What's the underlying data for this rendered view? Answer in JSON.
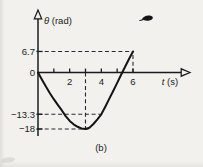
{
  "figure": {
    "caption": "(b)",
    "paper_color": "#f2f1ee",
    "ink_color": "#1b1b1b"
  },
  "labels": {
    "y_symbol": "θ",
    "y_unit": " (rad)",
    "x_symbol": "t",
    "x_unit": " (s)"
  },
  "chart_data": {
    "type": "line",
    "title": "",
    "xlabel": "t (s)",
    "ylabel": "θ (rad)",
    "xlim": [
      0,
      9.5
    ],
    "ylim": [
      -21,
      20
    ],
    "grid": false,
    "legend": "none",
    "x_ticks": [
      {
        "t": 1,
        "label": ""
      },
      {
        "t": 2,
        "label": "2"
      },
      {
        "t": 3,
        "label": ""
      },
      {
        "t": 4,
        "label": "4"
      },
      {
        "t": 5,
        "label": ""
      },
      {
        "t": 6,
        "label": "6"
      }
    ],
    "y_ticks": [
      {
        "v": 6.7,
        "label": "6.7",
        "tick": true
      },
      {
        "v": 0,
        "label": "0",
        "tick": false
      },
      {
        "v": -13.3,
        "label": "−13.3",
        "tick": true
      },
      {
        "v": -18,
        "label": "−18",
        "tick": true
      }
    ],
    "guides": [
      {
        "axis": "y",
        "value": 6.7,
        "t_end": 6
      },
      {
        "axis": "y",
        "value": -13.3,
        "t_end": 4.05
      },
      {
        "axis": "y",
        "value": -18,
        "t_end": 3.2
      },
      {
        "axis": "x",
        "value": 3,
        "v_end": -18
      },
      {
        "axis": "x",
        "value": 6,
        "v_end": 6.7
      }
    ],
    "key_points": {
      "start": [
        0,
        0
      ],
      "minimum": [
        3,
        -18
      ],
      "marked_point": [
        4,
        -13.3
      ],
      "zero_crossing": [
        5.3,
        0
      ],
      "end": [
        6,
        6.7
      ]
    },
    "series": [
      {
        "name": "theta-vs-t",
        "points": [
          [
            0,
            0
          ],
          [
            0.25,
            -2.3
          ],
          [
            0.5,
            -4.5
          ],
          [
            0.75,
            -6.6
          ],
          [
            1,
            -8.5
          ],
          [
            1.25,
            -10.3
          ],
          [
            1.5,
            -12.0
          ],
          [
            1.75,
            -13.9
          ],
          [
            2,
            -15.4
          ],
          [
            2.25,
            -16.5
          ],
          [
            2.5,
            -17.3
          ],
          [
            2.75,
            -17.8
          ],
          [
            3,
            -18
          ],
          [
            3.25,
            -17.6
          ],
          [
            3.5,
            -16.4
          ],
          [
            3.75,
            -14.9
          ],
          [
            4,
            -13.3
          ],
          [
            4.25,
            -10.9
          ],
          [
            4.5,
            -8.4
          ],
          [
            4.75,
            -5.9
          ],
          [
            5,
            -3.3
          ],
          [
            5.25,
            -0.7
          ],
          [
            5.5,
            1.8
          ],
          [
            5.75,
            4.3
          ],
          [
            6,
            6.7
          ]
        ]
      }
    ]
  }
}
